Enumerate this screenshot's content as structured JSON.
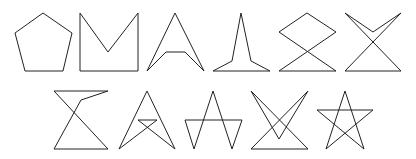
{
  "figure": {
    "background": "#ffffff",
    "stroke_color": "#222222",
    "stroke_width": 1,
    "rows": [
      {
        "shapes": [
          {
            "name": "pentagon",
            "points": "43,13 72,33 63,71 25,71 15,33"
          },
          {
            "name": "notched-square",
            "points": "80,13 108,52 138,13 138,71 80,71"
          },
          {
            "name": "arrowhead",
            "points": "175,13 204,71 185,52 166,52 147,71"
          },
          {
            "name": "spike",
            "points": "241,13 251,61 270,71 213,71 232,61"
          },
          {
            "name": "diamond-hourglass",
            "points": "279,71 336,71 279,32 307,13 336,32"
          },
          {
            "name": "x-bowtie",
            "points": "345,71 401,71 345,13 373,32 401,13"
          }
        ]
      },
      {
        "shapes": [
          {
            "name": "z-hourglass",
            "points": "54,91 108,91 81,100 54,149 108,149"
          },
          {
            "name": "a-crossed",
            "points": "119,149 147,91 175,149 138,120 157,120"
          },
          {
            "name": "a-bar-legs",
            "points": "185,120 242,120 232,149 213,91 194,149"
          },
          {
            "name": "double-v",
            "points": "251,149 308,149 251,91 279,139 308,91"
          },
          {
            "name": "pentagram",
            "points": "345,91 364,149 317,110 373,110 326,149"
          }
        ]
      }
    ]
  }
}
